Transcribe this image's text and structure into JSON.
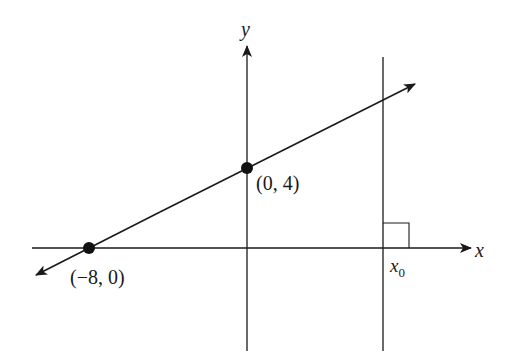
{
  "diagram": {
    "axes": {
      "x_label": "x",
      "y_label": "y"
    },
    "vertical_line": {
      "label_base": "x",
      "label_sub": "0"
    },
    "points": [
      {
        "label": "(−8, 0)",
        "x": -8,
        "y": 0
      },
      {
        "label": "(0, 4)",
        "x": 0,
        "y": 4
      }
    ],
    "line": {
      "slope": 0.5,
      "intercept": 4
    },
    "colors": {
      "stroke": "#1a1a1a",
      "background": "#ffffff"
    }
  }
}
